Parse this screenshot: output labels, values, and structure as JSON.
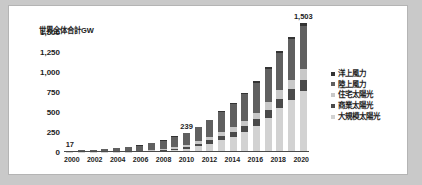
{
  "chart_data": {
    "type": "bar",
    "stacked": true,
    "title": "",
    "ylabel": "世界全体合計GW",
    "xlabel": "",
    "ylim": [
      0,
      1500
    ],
    "yticks": [
      "0",
      "250",
      "500",
      "750",
      "1,000",
      "1,250",
      "1,500"
    ],
    "ytick_values": [
      0,
      250,
      500,
      750,
      1000,
      1250,
      1500
    ],
    "grid": false,
    "legend_position": "right",
    "categories": [
      "2000",
      "2001",
      "2002",
      "2003",
      "2004",
      "2005",
      "2006",
      "2007",
      "2008",
      "2009",
      "2010",
      "2011",
      "2012",
      "2013",
      "2014",
      "2015",
      "2016",
      "2017",
      "2018",
      "2019",
      "2020"
    ],
    "xtick_labels": [
      "2000",
      "",
      "2002",
      "",
      "2004",
      "",
      "2006",
      "",
      "2008",
      "",
      "2010",
      "",
      "2012",
      "",
      "2014",
      "",
      "2016",
      "",
      "2018",
      "",
      "2020"
    ],
    "series": [
      {
        "name": "大規模太陽光",
        "color": "#d2d2d2",
        "values": [
          1,
          1,
          2,
          3,
          4,
          5,
          7,
          11,
          18,
          28,
          42,
          72,
          105,
          145,
          190,
          245,
          320,
          420,
          545,
          650,
          760
        ]
      },
      {
        "name": "商業太陽光",
        "color": "#4a4a4a",
        "values": [
          1,
          1,
          1,
          2,
          2,
          3,
          4,
          6,
          9,
          14,
          20,
          30,
          40,
          50,
          62,
          75,
          90,
          105,
          120,
          132,
          145
        ]
      },
      {
        "name": "住宅太陽光",
        "color": "#c8c8c8",
        "values": [
          1,
          1,
          2,
          2,
          3,
          4,
          5,
          7,
          10,
          15,
          21,
          30,
          40,
          50,
          60,
          70,
          82,
          95,
          108,
          118,
          128
        ]
      },
      {
        "name": "陸上風力",
        "color": "#606060",
        "values": [
          13,
          17,
          23,
          31,
          40,
          51,
          65,
          83,
          106,
          135,
          150,
          175,
          210,
          250,
          290,
          330,
          375,
          420,
          465,
          510,
          545
        ]
      },
      {
        "name": "洋上風力",
        "color": "#333333",
        "values": [
          1,
          1,
          1,
          1,
          1,
          2,
          2,
          3,
          4,
          5,
          6,
          8,
          10,
          12,
          14,
          17,
          20,
          24,
          28,
          31,
          35
        ]
      }
    ],
    "totals": [
      17,
      21,
      29,
      39,
      50,
      65,
      83,
      110,
      147,
      197,
      239,
      315,
      405,
      507,
      616,
      737,
      887,
      1064,
      1266,
      1441,
      1503
    ],
    "data_labels": [
      {
        "category": "2000",
        "text": "17"
      },
      {
        "category": "2010",
        "text": "239"
      },
      {
        "category": "2020",
        "text": "1,503"
      }
    ]
  },
  "colors": {
    "page_background": "#c9c9c9",
    "figure_background": "#ffffff",
    "figure_border": "#b4b4b4",
    "axis_line": "#4a4a4a",
    "text": "#1d1d1d"
  }
}
